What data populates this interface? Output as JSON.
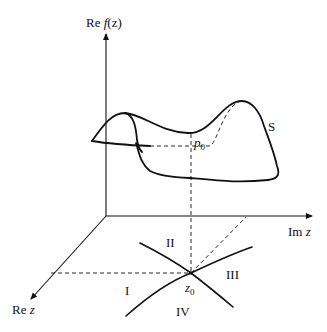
{
  "diagram": {
    "type": "saddle-point surface over complex plane",
    "axes": {
      "vertical": {
        "label_prefix": "Re ",
        "label_func": "f",
        "label_arg": "(z)"
      },
      "horizontal": {
        "label_prefix": "Im ",
        "label_var": "z"
      },
      "depth": {
        "label_prefix": "Re ",
        "label_var": "z"
      }
    },
    "surface": {
      "label": "S"
    },
    "saddle_point": {
      "label_base": "p",
      "label_sub": "0"
    },
    "critical_point": {
      "label_base": "z",
      "label_sub": "0"
    },
    "regions": [
      "I",
      "II",
      "III",
      "IV"
    ],
    "colors": {
      "line": "#111111",
      "background": "#ffffff"
    }
  }
}
